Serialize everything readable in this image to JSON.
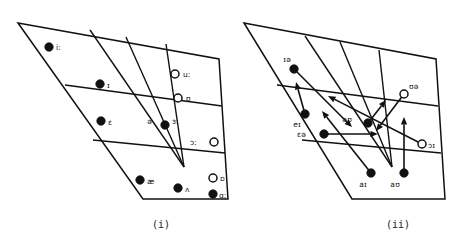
{
  "figure": {
    "background_color": "#ffffff",
    "ink_color": "#111111",
    "panels": [
      {
        "id": "panel-i",
        "caption": "(i)",
        "description": "Monophthongs of English plotted on a vowel quadrilateral"
      },
      {
        "id": "panel-ii",
        "caption": "(ii)",
        "description": "Diphthongs of English plotted with glide arrows on a vowel quadrilateral"
      }
    ]
  },
  "chart_data": [
    {
      "type": "scatter",
      "id": "monophthongs",
      "title": "(i)",
      "xlabel": "",
      "ylabel": "",
      "grid": true,
      "legend": "none",
      "note": "Filled markers = unrounded vowels; open markers = rounded vowels. Coordinates are SVG pixel positions within the quadrilateral.",
      "marker_styles": {
        "filled": "unrounded",
        "open": "rounded"
      },
      "points": [
        {
          "label": "iː",
          "x": 49,
          "y": 47,
          "marker": "filled",
          "label_dx": 7,
          "label_dy": 3
        },
        {
          "label": "ɪ",
          "x": 100,
          "y": 84,
          "marker": "filled",
          "label_dx": 7,
          "label_dy": 4
        },
        {
          "label": "ɛ",
          "x": 101,
          "y": 121,
          "marker": "filled",
          "label_dx": 7,
          "label_dy": 4
        },
        {
          "label": "ə",
          "x": 165,
          "y": 125,
          "marker": "filled",
          "label_dx": -13,
          "label_dy": -1
        },
        {
          "label": "ɜː",
          "x": 165,
          "y": 125,
          "marker": "none",
          "label_dx": 7,
          "label_dy": -1
        },
        {
          "label": "æ",
          "x": 140,
          "y": 180,
          "marker": "filled",
          "label_dx": 7,
          "label_dy": 4
        },
        {
          "label": "ʌ",
          "x": 178,
          "y": 188,
          "marker": "filled",
          "label_dx": 7,
          "label_dy": 4
        },
        {
          "label": "ɑː",
          "x": 213,
          "y": 194,
          "marker": "filled",
          "label_dx": 6,
          "label_dy": 4
        },
        {
          "label": "uː",
          "x": 175,
          "y": 74,
          "marker": "open",
          "label_dx": 8,
          "label_dy": 3
        },
        {
          "label": "ʊ",
          "x": 178,
          "y": 98,
          "marker": "open",
          "label_dx": 8,
          "label_dy": 3
        },
        {
          "label": "ɔː",
          "x": 214,
          "y": 142,
          "marker": "open",
          "label_dx": -17,
          "label_dy": 3
        },
        {
          "label": "ɒ",
          "x": 213,
          "y": 178,
          "marker": "open",
          "label_dx": 7,
          "label_dy": 3
        }
      ]
    },
    {
      "type": "scatter",
      "id": "diphthongs",
      "title": "(ii)",
      "xlabel": "",
      "ylabel": "",
      "grid": true,
      "legend": "none",
      "note": "Arrows run from the starting quality to the ending quality of each diphthong. Filled start markers = unrounded onset; open start markers = rounded onset.",
      "marker_styles": {
        "filled": "unrounded onset",
        "open": "rounded onset"
      },
      "points": [
        {
          "label": "ɪə",
          "x": 294,
          "y": 69,
          "marker": "filled",
          "label_dx": -3,
          "label_dy": -7
        },
        {
          "label": "eɪ",
          "x": 305,
          "y": 114,
          "marker": "filled",
          "label_dx": -4,
          "label_dy": 13
        },
        {
          "label": "ɛə",
          "x": 324,
          "y": 134,
          "marker": "filled",
          "label_dx": -18,
          "label_dy": 3
        },
        {
          "label": "əʊ",
          "x": 368,
          "y": 123,
          "marker": "filled",
          "label_dx": -16,
          "label_dy": -1
        },
        {
          "label": "aɪ",
          "x": 371,
          "y": 173,
          "marker": "filled",
          "label_dx": -4,
          "label_dy": 14
        },
        {
          "label": "aʊ",
          "x": 404,
          "y": 173,
          "marker": "filled",
          "label_dx": -4,
          "label_dy": 14
        },
        {
          "label": "ʊə",
          "x": 404,
          "y": 94,
          "marker": "open",
          "label_dx": 5,
          "label_dy": -5
        },
        {
          "label": "ɔɪ",
          "x": 422,
          "y": 144,
          "marker": "open",
          "label_dx": 6,
          "label_dy": 4
        }
      ],
      "arrows": [
        {
          "from_label": "ɪə",
          "x1": 294,
          "y1": 69,
          "x2": 352,
          "y2": 127
        },
        {
          "from_label": "eɪ",
          "x1": 305,
          "y1": 114,
          "x2": 296,
          "y2": 82
        },
        {
          "from_label": "ɛə",
          "x1": 324,
          "y1": 134,
          "x2": 378,
          "y2": 134
        },
        {
          "from_label": "əʊ",
          "x1": 368,
          "y1": 123,
          "x2": 386,
          "y2": 100
        },
        {
          "from_label": "aɪ",
          "x1": 371,
          "y1": 173,
          "x2": 322,
          "y2": 111
        },
        {
          "from_label": "aʊ",
          "x1": 404,
          "y1": 173,
          "x2": 404,
          "y2": 117
        },
        {
          "from_label": "ʊə",
          "x1": 404,
          "y1": 94,
          "x2": 376,
          "y2": 131
        },
        {
          "from_label": "ɔɪ",
          "x1": 422,
          "y1": 144,
          "x2": 328,
          "y2": 96
        }
      ]
    }
  ]
}
